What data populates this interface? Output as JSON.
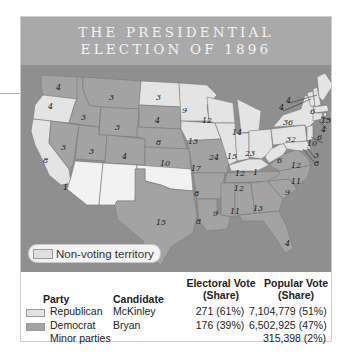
{
  "title": {
    "line1": "THE PRESIDENTIAL",
    "line2": "ELECTION OF 1896"
  },
  "colors": {
    "republican": "#e4e4e4",
    "democrat": "#a3a3a3",
    "non_voting": "#f2f2f2",
    "water": "#8f8f8f",
    "title_band": "#a9a9a9"
  },
  "map": {
    "state_electoral_votes": [
      {
        "state": "Washington",
        "votes": "4",
        "party": "Democrat"
      },
      {
        "state": "Oregon",
        "votes": "4",
        "party": "Republican"
      },
      {
        "state": "California",
        "votes": "8",
        "party": "Republican"
      },
      {
        "state": "California (split)",
        "votes": "1",
        "party": "Democrat"
      },
      {
        "state": "Nevada",
        "votes": "3",
        "party": "Democrat"
      },
      {
        "state": "Idaho",
        "votes": "3",
        "party": "Democrat"
      },
      {
        "state": "Montana",
        "votes": "3",
        "party": "Democrat"
      },
      {
        "state": "Wyoming",
        "votes": "3",
        "party": "Democrat"
      },
      {
        "state": "Utah",
        "votes": "3",
        "party": "Democrat"
      },
      {
        "state": "Colorado",
        "votes": "4",
        "party": "Democrat"
      },
      {
        "state": "North Dakota",
        "votes": "3",
        "party": "Republican"
      },
      {
        "state": "South Dakota",
        "votes": "4",
        "party": "Democrat"
      },
      {
        "state": "Nebraska",
        "votes": "8",
        "party": "Democrat"
      },
      {
        "state": "Kansas",
        "votes": "10",
        "party": "Democrat"
      },
      {
        "state": "Texas",
        "votes": "15",
        "party": "Democrat"
      },
      {
        "state": "Minnesota",
        "votes": "9",
        "party": "Republican"
      },
      {
        "state": "Iowa",
        "votes": "13",
        "party": "Republican"
      },
      {
        "state": "Missouri",
        "votes": "17",
        "party": "Democrat"
      },
      {
        "state": "Arkansas",
        "votes": "8",
        "party": "Democrat"
      },
      {
        "state": "Louisiana",
        "votes": "8",
        "party": "Democrat"
      },
      {
        "state": "Wisconsin",
        "votes": "12",
        "party": "Republican"
      },
      {
        "state": "Illinois",
        "votes": "24",
        "party": "Republican"
      },
      {
        "state": "Michigan",
        "votes": "14",
        "party": "Republican"
      },
      {
        "state": "Indiana",
        "votes": "15",
        "party": "Republican"
      },
      {
        "state": "Ohio",
        "votes": "23",
        "party": "Republican"
      },
      {
        "state": "Kentucky",
        "votes": "12",
        "party": "Republican"
      },
      {
        "state": "Kentucky (split)",
        "votes": "1",
        "party": "Democrat"
      },
      {
        "state": "Tennessee",
        "votes": "12",
        "party": "Democrat"
      },
      {
        "state": "Mississippi",
        "votes": "9",
        "party": "Democrat"
      },
      {
        "state": "Alabama",
        "votes": "11",
        "party": "Democrat"
      },
      {
        "state": "Georgia",
        "votes": "13",
        "party": "Democrat"
      },
      {
        "state": "Florida",
        "votes": "4",
        "party": "Democrat"
      },
      {
        "state": "South Carolina",
        "votes": "9",
        "party": "Democrat"
      },
      {
        "state": "North Carolina",
        "votes": "11",
        "party": "Democrat"
      },
      {
        "state": "Virginia",
        "votes": "12",
        "party": "Democrat"
      },
      {
        "state": "West Virginia",
        "votes": "6",
        "party": "Republican"
      },
      {
        "state": "Pennsylvania",
        "votes": "32",
        "party": "Republican"
      },
      {
        "state": "New York",
        "votes": "36",
        "party": "Republican"
      },
      {
        "state": "Vermont",
        "votes": "4",
        "party": "Republican"
      },
      {
        "state": "New Hampshire",
        "votes": "4",
        "party": "Republican"
      },
      {
        "state": "Maine",
        "votes": "6",
        "party": "Republican"
      },
      {
        "state": "Massachusetts",
        "votes": "15",
        "party": "Republican"
      },
      {
        "state": "Rhode Island",
        "votes": "4",
        "party": "Republican"
      },
      {
        "state": "Connecticut",
        "votes": "6",
        "party": "Republican"
      },
      {
        "state": "New Jersey",
        "votes": "10",
        "party": "Republican"
      },
      {
        "state": "Delaware",
        "votes": "3",
        "party": "Republican"
      },
      {
        "state": "Maryland",
        "votes": "8",
        "party": "Republican"
      }
    ],
    "non_voting": [
      "Arizona Territory",
      "New Mexico Territory",
      "Oklahoma Territory",
      "Indian Territory"
    ]
  },
  "legend": {
    "non_voting_label": "Non-voting territory"
  },
  "table": {
    "headers": {
      "party": "Party",
      "candidate": "Candidate",
      "electoral_l1": "Electoral Vote",
      "electoral_l2": "(Share)",
      "popular_l1": "Popular Vote",
      "popular_l2": "(Share)"
    },
    "rows": [
      {
        "party": "Republican",
        "candidate": "McKinley",
        "electoral": "271 (61%)",
        "popular": "7,104,779 (51%)"
      },
      {
        "party": "Democrat",
        "candidate": "Bryan",
        "electoral": "176 (39%)",
        "popular": "6,502,925 (47%)"
      },
      {
        "party": "Minor parties",
        "candidate": "",
        "electoral": "",
        "popular": "315,398 (2%)"
      }
    ]
  }
}
